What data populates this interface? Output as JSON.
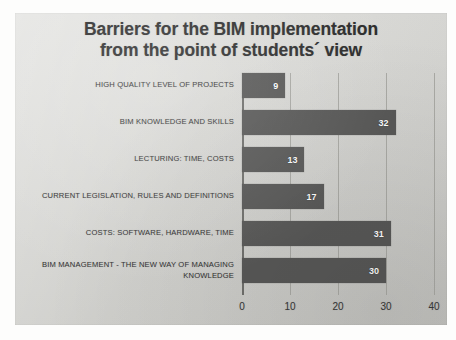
{
  "chart_data": {
    "type": "bar",
    "orientation": "horizontal",
    "title": "Barriers for the BIM implementation from the point of students´ view",
    "title_lines": [
      "Barriers for the BIM implementation",
      "from the point of students´ view"
    ],
    "categories": [
      "HIGH QUALITY LEVEL OF PROJECTS",
      "BIM KNOWLEDGE AND SKILLS",
      "LECTURING: TIME, COSTS",
      "CURRENT LEGISLATION, RULES AND DEFINITIONS",
      "COSTS: SOFTWARE, HARDWARE, TIME",
      "BIM MANAGEMENT - THE NEW WAY OF MANAGING KNOWLEDGE"
    ],
    "values": [
      9,
      32,
      13,
      17,
      31,
      30
    ],
    "data_labels": [
      "9",
      "32",
      "13",
      "17",
      "31",
      "30"
    ],
    "xlabel": "",
    "ylabel": "",
    "xlim": [
      0,
      40
    ],
    "xticks": [
      0,
      10,
      20,
      30,
      40
    ],
    "xtick_labels": [
      "0",
      "10",
      "20",
      "30",
      "40"
    ],
    "grid": true,
    "grid_axis": "x",
    "legend": false,
    "bar_color": "#585857",
    "data_label_color": "#ffffff",
    "background_color": "#d2d2ce",
    "title_color": "#2b2b2b",
    "gridline_color": "#a9a9a4",
    "axis_color": "#6f6f6c"
  }
}
